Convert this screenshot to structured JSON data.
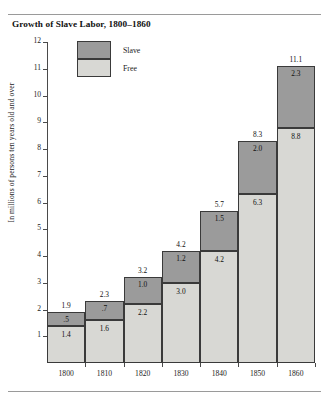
{
  "chart_data": {
    "type": "bar",
    "subtype": "stacked",
    "title": "Growth of Slave Labor, 1800–1860",
    "xlabel": "",
    "ylabel": "In millions of persons ten years old and over",
    "categories": [
      "1800",
      "1810",
      "1820",
      "1830",
      "1840",
      "1850",
      "1860"
    ],
    "ylim": [
      0,
      12
    ],
    "yticks": [
      "1",
      "2",
      "3",
      "4",
      "5",
      "6",
      "7",
      "8",
      "9",
      "10",
      "11",
      "12"
    ],
    "grid": false,
    "legend_position": "top-left-inside",
    "series": [
      {
        "name": "Free",
        "color": "#d8d8d4",
        "values": [
          1.4,
          1.6,
          2.2,
          3.0,
          4.2,
          6.3,
          8.8
        ],
        "labels": [
          "1.4",
          "1.6",
          "2.2",
          "3.0",
          "4.2",
          "6.3",
          "8.8"
        ]
      },
      {
        "name": "Slave",
        "color": "#9b9b9b",
        "values": [
          0.5,
          0.7,
          1.0,
          1.2,
          1.5,
          2.0,
          2.3
        ],
        "labels": [
          ".5",
          ".7",
          "1.0",
          "1.2",
          "1.5",
          "2.0",
          "2.3"
        ]
      }
    ],
    "totals": [
      1.9,
      2.3,
      3.2,
      4.2,
      5.7,
      8.3,
      11.1
    ],
    "total_labels": [
      "1.9",
      "2.3",
      "3.2",
      "4.2",
      "5.7",
      "8.3",
      "11.1"
    ]
  },
  "legend": {
    "slave_label": "Slave",
    "free_label": "Free"
  }
}
